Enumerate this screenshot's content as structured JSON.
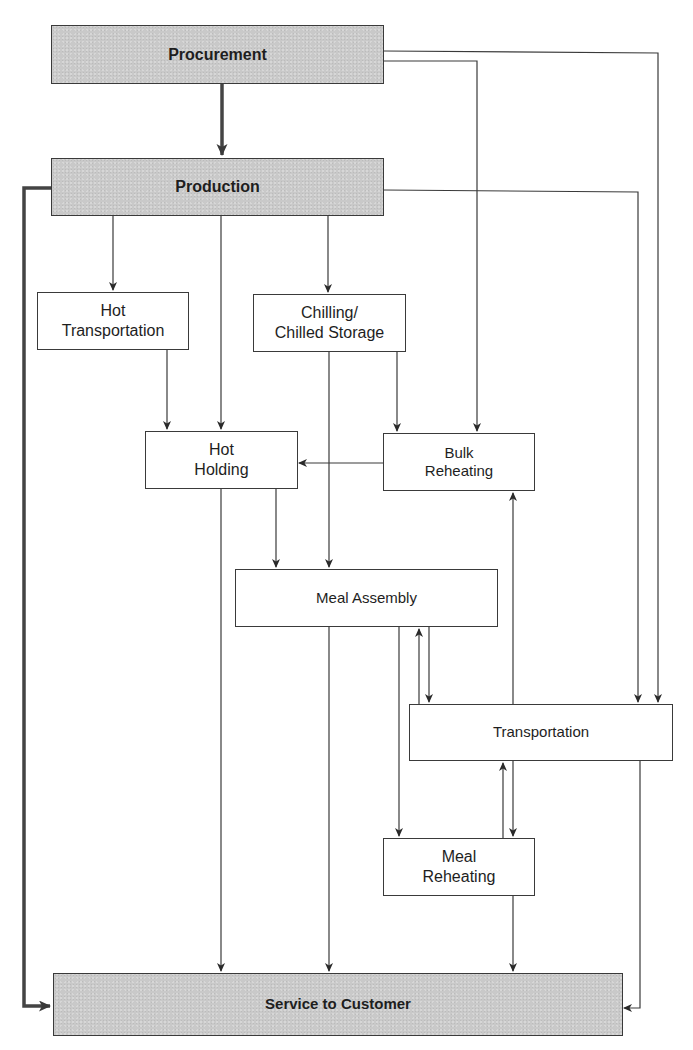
{
  "diagram": {
    "type": "flowchart",
    "nodes": {
      "procurement": {
        "label": "Procurement",
        "style": "shaded"
      },
      "production": {
        "label": "Production",
        "style": "shaded"
      },
      "hot_transportation": {
        "label": "Hot\nTransportation",
        "style": "plain"
      },
      "chilling": {
        "label": "Chilling/\nChilled Storage",
        "style": "plain"
      },
      "hot_holding": {
        "label": "Hot\nHolding",
        "style": "plain"
      },
      "bulk_reheating": {
        "label": "Bulk\nReheating",
        "style": "plain"
      },
      "meal_assembly": {
        "label": "Meal Assembly",
        "style": "plain"
      },
      "transportation": {
        "label": "Transportation",
        "style": "plain"
      },
      "meal_reheating": {
        "label": "Meal\nReheating",
        "style": "plain"
      },
      "service": {
        "label": "Service to Customer",
        "style": "shaded"
      }
    },
    "edges": [
      {
        "from": "Procurement",
        "to": "Production",
        "weight": "thick"
      },
      {
        "from": "Procurement",
        "to": "Bulk Reheating"
      },
      {
        "from": "Procurement",
        "to": "Transportation"
      },
      {
        "from": "Production",
        "to": "Hot Transportation"
      },
      {
        "from": "Production",
        "to": "Hot Holding"
      },
      {
        "from": "Production",
        "to": "Chilling/Chilled Storage"
      },
      {
        "from": "Production",
        "to": "Transportation"
      },
      {
        "from": "Production",
        "to": "Service to Customer",
        "weight": "thick"
      },
      {
        "from": "Hot Transportation",
        "to": "Hot Holding"
      },
      {
        "from": "Chilling/Chilled Storage",
        "to": "Bulk Reheating"
      },
      {
        "from": "Chilling/Chilled Storage",
        "to": "Meal Assembly"
      },
      {
        "from": "Bulk Reheating",
        "to": "Hot Holding"
      },
      {
        "from": "Hot Holding",
        "to": "Meal Assembly"
      },
      {
        "from": "Hot Holding",
        "to": "Service to Customer"
      },
      {
        "from": "Meal Assembly",
        "to": "Transportation"
      },
      {
        "from": "Transportation",
        "to": "Meal Assembly"
      },
      {
        "from": "Meal Assembly",
        "to": "Meal Reheating"
      },
      {
        "from": "Meal Assembly",
        "to": "Service to Customer"
      },
      {
        "from": "Transportation",
        "to": "Bulk Reheating"
      },
      {
        "from": "Transportation",
        "to": "Meal Reheating"
      },
      {
        "from": "Meal Reheating",
        "to": "Transportation"
      },
      {
        "from": "Transportation",
        "to": "Service to Customer"
      },
      {
        "from": "Meal Reheating",
        "to": "Service to Customer"
      }
    ]
  },
  "colors": {
    "shaded_fill": "#c9c9c9",
    "line": "#3a3a3a",
    "thick_line": "#444444"
  }
}
